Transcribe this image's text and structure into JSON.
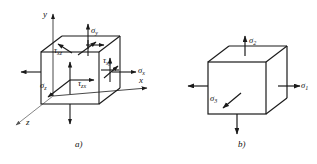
{
  "figure": {
    "type": "stress-element-diagram",
    "width": 317,
    "height": 164,
    "background": "#ffffff",
    "line_color": "#1a1a1a",
    "panels": [
      {
        "id": "a",
        "caption": "a)",
        "description": "General triaxial stress element with coordinate axes",
        "axes": [
          {
            "name": "y-axis",
            "label": "y",
            "direction": "up"
          },
          {
            "name": "x-axis",
            "label": "x",
            "direction": "right"
          },
          {
            "name": "z-axis",
            "label": "z",
            "direction": "down-left"
          }
        ],
        "stress_labels": [
          {
            "name": "sigma-y",
            "text": "σ",
            "sub": "y",
            "face": "top",
            "arrow": "up"
          },
          {
            "name": "sigma-x",
            "text": "σ",
            "sub": "x",
            "face": "right",
            "arrow": "right"
          },
          {
            "name": "sigma-z",
            "text": "σ",
            "sub": "z",
            "face": "front",
            "arrow": "down-left-diagonal"
          },
          {
            "name": "tau-xz",
            "text": "τ",
            "sub": "xz",
            "face": "top",
            "arrow": "diagonal"
          },
          {
            "name": "tau-xy",
            "text": "τ",
            "sub": "xy",
            "face": "right",
            "arrow": "up"
          },
          {
            "name": "tau-zx",
            "text": "τ",
            "sub": "zx",
            "face": "front",
            "arrow": "right"
          }
        ]
      },
      {
        "id": "b",
        "caption": "b)",
        "description": "Principal stress element",
        "axes": [],
        "stress_labels": [
          {
            "name": "sigma-2",
            "text": "σ",
            "sub": "2",
            "face": "top",
            "arrow": "up"
          },
          {
            "name": "sigma-1",
            "text": "σ",
            "sub": "1",
            "face": "right",
            "arrow": "right"
          },
          {
            "name": "sigma-3",
            "text": "σ",
            "sub": "3",
            "face": "front",
            "arrow": "down-left-diagonal"
          }
        ]
      }
    ]
  }
}
